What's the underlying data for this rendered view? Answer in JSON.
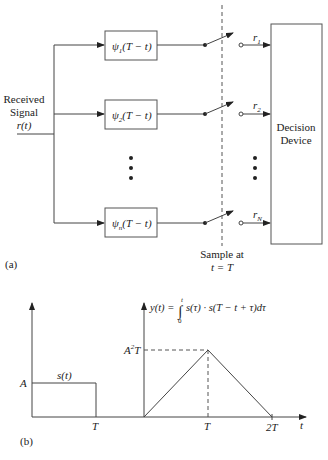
{
  "part_a": {
    "label": "(a)",
    "input": {
      "line1": "Received",
      "line2": "Signal",
      "line3": "r(t)"
    },
    "filters": [
      {
        "psi": "ψ",
        "sub": "1",
        "arg": "(T − t)"
      },
      {
        "psi": "ψ",
        "sub": "2",
        "arg": "(T − t)"
      },
      {
        "psi": "ψ",
        "sub": "n",
        "arg": "(T − t)"
      }
    ],
    "outputs": [
      {
        "r": "r",
        "sub": "1"
      },
      {
        "r": "r",
        "sub": "2"
      },
      {
        "r": "r",
        "sub": "N"
      }
    ],
    "decision": {
      "line1": "Decision",
      "line2": "Device"
    },
    "sample": {
      "line1": "Sample at",
      "line2": "t = T"
    }
  },
  "part_b": {
    "label": "(b)",
    "left_plot": {
      "curve_label": "s(t)",
      "y_tick": "A",
      "x_tick": "T"
    },
    "right_plot": {
      "y_axis_label": "y(t) =",
      "integral_upper": "t",
      "integral_lower": "0",
      "integrand": "s(τ) · s(T − t + τ)dτ",
      "y_tick_base": "A",
      "y_tick_sup": "2",
      "y_tick_tail": "T",
      "x_tick_1": "T",
      "x_tick_2": "2T",
      "x_axis_label": "t"
    }
  }
}
